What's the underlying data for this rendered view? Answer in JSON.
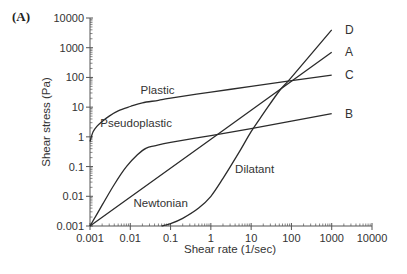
{
  "panel_label": "(A)",
  "chart_data": {
    "type": "line",
    "title": "",
    "xlabel": "Shear rate (1/sec)",
    "ylabel": "Shear stress (Pa)",
    "xscale": "log",
    "yscale": "log",
    "xlim": [
      0.001,
      10000
    ],
    "ylim": [
      0.001,
      10000
    ],
    "xticks": [
      "0.001",
      "0.01",
      "0.1",
      "1",
      "10",
      "100",
      "1000",
      "10000"
    ],
    "yticks": [
      "0.001",
      "0.01",
      "0.1",
      "1",
      "10",
      "100",
      "1000",
      "10000"
    ],
    "grid": false,
    "legend": "none",
    "series": [
      {
        "name": "Plastic",
        "letter": "C",
        "label_pos": [
          0.018,
          28
        ],
        "x": [
          0.001,
          0.0012,
          0.0015,
          0.002,
          0.003,
          0.005,
          0.01,
          0.02,
          0.05,
          0.1,
          1,
          10,
          100,
          1000
        ],
        "y": [
          0.7,
          1.5,
          2.3,
          3.3,
          5,
          7.5,
          10.5,
          14,
          17,
          20,
          32,
          50,
          78,
          120
        ]
      },
      {
        "name": "Pseudoplastic",
        "letter": "B",
        "label_pos": [
          0.0018,
          2.2
        ],
        "x": [
          0.001,
          0.002,
          0.004,
          0.008,
          0.015,
          0.025,
          0.04,
          0.1,
          1,
          10,
          100,
          1000
        ],
        "y": [
          0.001,
          0.005,
          0.025,
          0.1,
          0.25,
          0.42,
          0.5,
          0.65,
          1.1,
          1.9,
          3.4,
          6
        ]
      },
      {
        "name": "Newtonian",
        "letter": "A",
        "label_pos": [
          0.012,
          0.0045
        ],
        "x": [
          0.001,
          1000
        ],
        "y": [
          0.001,
          700
        ]
      },
      {
        "name": "Dilatant",
        "letter": "D",
        "label_pos": [
          4,
          0.06
        ],
        "x": [
          0.06,
          0.1,
          0.2,
          0.5,
          1,
          2,
          5,
          10,
          20,
          50,
          100,
          1000
        ],
        "y": [
          0.001,
          0.0012,
          0.0018,
          0.004,
          0.01,
          0.04,
          0.3,
          1.5,
          6,
          35,
          100,
          4000
        ]
      }
    ]
  },
  "colors": {
    "line": "#2b2b2b",
    "axis": "#555555",
    "text": "#333333"
  }
}
